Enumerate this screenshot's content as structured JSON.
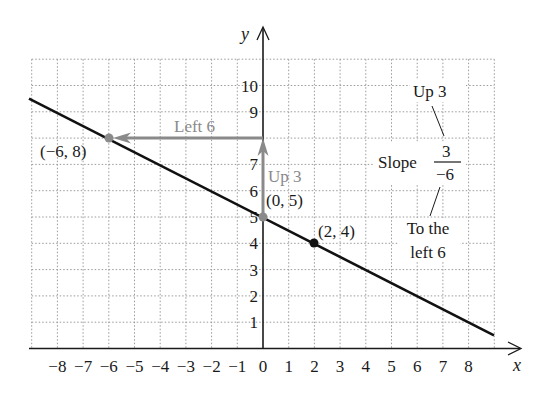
{
  "chart_data": {
    "type": "line",
    "title": "",
    "xlabel": "x",
    "ylabel": "y",
    "xlim": [
      -9,
      9
    ],
    "ylim": [
      0,
      11
    ],
    "grid": true,
    "x_ticks": [
      -8,
      -7,
      -6,
      -5,
      -4,
      -3,
      -2,
      -1,
      0,
      1,
      2,
      3,
      4,
      5,
      6,
      7,
      8
    ],
    "y_ticks": [
      1,
      2,
      3,
      4,
      5,
      6,
      7,
      8,
      9,
      10
    ],
    "series": [
      {
        "name": "line",
        "equation": "y = -1/2 x + 5",
        "x": [
          -9,
          9
        ],
        "y": [
          9.5,
          0.5
        ],
        "color": "#111111"
      }
    ],
    "points": [
      {
        "label": "(−6, 8)",
        "x": -6,
        "y": 8,
        "color": "#8a8a8a"
      },
      {
        "label": "(0, 5)",
        "x": 0,
        "y": 5,
        "color": "#8a8a8a"
      },
      {
        "label": "(2, 4)",
        "x": 2,
        "y": 4,
        "color": "#111111"
      }
    ],
    "annotations": [
      {
        "type": "arrow",
        "from": [
          0,
          5
        ],
        "to": [
          0,
          8
        ],
        "label": "Up 3",
        "color": "#8a8a8a"
      },
      {
        "type": "arrow",
        "from": [
          0,
          8
        ],
        "to": [
          -6,
          8
        ],
        "label": "Left 6",
        "color": "#8a8a8a"
      },
      {
        "type": "text",
        "text": "Up 3"
      },
      {
        "type": "text",
        "text": "Slope 3 / −6"
      },
      {
        "type": "text",
        "text": "To the left 6"
      }
    ]
  },
  "labels": {
    "x_axis": "x",
    "y_axis": "y",
    "x_ticks": [
      "−8",
      "−7",
      "−6",
      "−5",
      "−4",
      "−3",
      "−2",
      "−1",
      "0",
      "1",
      "2",
      "3",
      "4",
      "5",
      "6",
      "7",
      "8"
    ],
    "y_ticks": [
      "1",
      "2",
      "3",
      "4",
      "5",
      "6",
      "7",
      "8",
      "9",
      "10"
    ],
    "point_neg6_8": "(−6, 8)",
    "point_0_5": "(0, 5)",
    "point_2_4": "(2, 4)",
    "arrow_up": "Up 3",
    "arrow_left": "Left 6",
    "slope_up_note": "Up 3",
    "slope_word": "Slope",
    "slope_numerator": "3",
    "slope_denominator": "−6",
    "slope_left_note_line1": "To the",
    "slope_left_note_line2": "left 6"
  },
  "colors": {
    "line": "#111111",
    "axis": "#1a1a1a",
    "grid": "#9a9a9a",
    "highlight": "#8a8a8a"
  }
}
